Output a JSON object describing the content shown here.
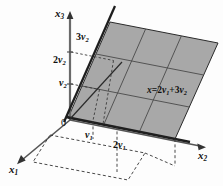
{
  "figure": {
    "background_color": "#fdfdfd",
    "plane_fill_color": "#a8a8a8",
    "plane_edge_color": "#2b2b2b",
    "axis_color": "#555555",
    "dashed_color": "#333333",
    "grid_line_color": "#4a4a4a"
  },
  "axes": [
    {
      "key": "x1",
      "label_text": "x",
      "label_sub": "1",
      "direction": "lower-left",
      "arrow": true
    },
    {
      "key": "x2",
      "label_text": "x",
      "label_sub": "2",
      "direction": "right",
      "arrow": true
    },
    {
      "key": "x3",
      "label_text": "x",
      "label_sub": "3",
      "direction": "up",
      "arrow": true
    }
  ],
  "origin": {
    "label": "0"
  },
  "vertical_ticks": [
    {
      "coef": "",
      "vec": "v",
      "sub": "2",
      "text": "v2"
    },
    {
      "coef": "2",
      "vec": "v",
      "sub": "2",
      "text": "2v2"
    },
    {
      "coef": "3",
      "vec": "v",
      "sub": "2",
      "text": "3v2"
    }
  ],
  "horizontal_ticks": [
    {
      "coef": "",
      "vec": "v",
      "sub": "1",
      "text": "v1"
    },
    {
      "coef": "2",
      "vec": "v",
      "sub": "1",
      "text": "2v1"
    }
  ],
  "annotation": {
    "equation_lhs": "x",
    "equation_eq": "=",
    "equation_term1_coef": "2",
    "equation_term1_vec": "v",
    "equation_term1_sub": "1",
    "equation_plus": "+",
    "equation_term2_coef": "3",
    "equation_term2_vec": "v",
    "equation_term2_sub": "2",
    "equation_full": "x=2v1+3v2"
  },
  "plane": {
    "shape": "parallelogram",
    "grid_rows": 3,
    "grid_cols": 3,
    "shaded": true
  },
  "floor_projection": {
    "style": "dashed",
    "shape": "parallelogram"
  }
}
